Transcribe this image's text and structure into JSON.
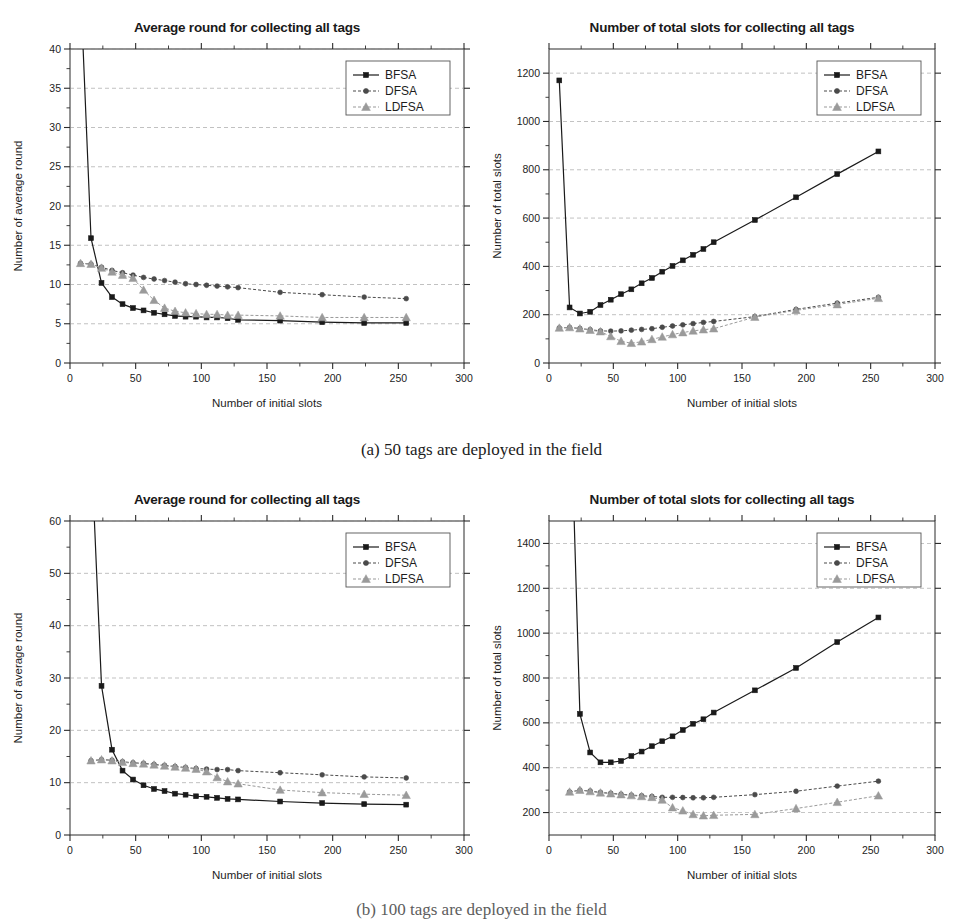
{
  "figure": {
    "caption_a": "(a) 50 tags are deployed in the field",
    "caption_b": "(b) 100 tags are deployed in the field",
    "series_names": [
      "BFSA",
      "DFSA",
      "LDFSA"
    ],
    "colors": {
      "bfsa": "#1a1a1a",
      "dfsa": "#4a4a4a",
      "ldfsa": "#9a9a9a",
      "grid": "#8a8a8a",
      "axis": "#2b2b2b"
    }
  },
  "chart_data": [
    {
      "id": "a-left",
      "type": "line",
      "title": "Average round for collecting all tags",
      "xlabel": "Number of initial slots",
      "ylabel": "Number of average round",
      "xlim": [
        0,
        300
      ],
      "ylim": [
        0,
        40
      ],
      "xticks": [
        0,
        50,
        100,
        150,
        200,
        250,
        300
      ],
      "yticks": [
        0,
        5,
        10,
        15,
        20,
        25,
        30,
        35,
        40
      ],
      "grid": true,
      "legend_position": "top-right",
      "series": [
        {
          "name": "BFSA",
          "marker": "square",
          "x": [
            8,
            16,
            24,
            32,
            40,
            48,
            56,
            64,
            72,
            80,
            88,
            96,
            104,
            112,
            120,
            128,
            160,
            192,
            224,
            256
          ],
          "y": [
            48.0,
            15.9,
            10.2,
            8.4,
            7.5,
            7.0,
            6.7,
            6.4,
            6.2,
            6.0,
            5.9,
            5.9,
            5.8,
            5.8,
            5.7,
            5.5,
            5.4,
            5.2,
            5.1,
            5.1
          ]
        },
        {
          "name": "DFSA",
          "marker": "circle",
          "x": [
            8,
            16,
            24,
            32,
            40,
            48,
            56,
            64,
            72,
            80,
            88,
            96,
            104,
            112,
            120,
            128,
            160,
            192,
            224,
            256
          ],
          "y": [
            12.7,
            12.6,
            12.2,
            11.8,
            11.5,
            11.2,
            10.9,
            10.7,
            10.5,
            10.3,
            10.1,
            10.0,
            9.9,
            9.8,
            9.7,
            9.6,
            9.0,
            8.7,
            8.4,
            8.2
          ]
        },
        {
          "name": "LDFSA",
          "marker": "triangle",
          "x": [
            8,
            16,
            24,
            32,
            40,
            48,
            56,
            64,
            72,
            80,
            88,
            96,
            104,
            112,
            120,
            128,
            160,
            192,
            224,
            256
          ],
          "y": [
            12.7,
            12.6,
            12.1,
            11.6,
            11.2,
            10.8,
            9.3,
            8.0,
            7.0,
            6.6,
            6.4,
            6.3,
            6.2,
            6.2,
            6.1,
            6.1,
            6.0,
            5.8,
            5.8,
            5.8
          ]
        }
      ]
    },
    {
      "id": "a-right",
      "type": "line",
      "title": "Number of total slots for collecting all tags",
      "xlabel": "Number of initial slots",
      "ylabel": "Number of total slots",
      "xlim": [
        0,
        300
      ],
      "ylim": [
        0,
        1300
      ],
      "xticks": [
        0,
        50,
        100,
        150,
        200,
        250,
        300
      ],
      "yticks": [
        0,
        200,
        400,
        600,
        800,
        1000,
        1200
      ],
      "grid": true,
      "legend_position": "top-right",
      "series": [
        {
          "name": "BFSA",
          "marker": "square",
          "x": [
            8,
            16,
            24,
            32,
            40,
            48,
            56,
            64,
            72,
            80,
            88,
            96,
            104,
            112,
            120,
            128,
            160,
            192,
            224,
            256
          ],
          "y": [
            1170,
            230,
            205,
            212,
            240,
            262,
            285,
            305,
            330,
            352,
            378,
            402,
            425,
            448,
            472,
            500,
            592,
            686,
            782,
            876
          ]
        },
        {
          "name": "DFSA",
          "marker": "circle",
          "x": [
            8,
            16,
            24,
            32,
            40,
            48,
            56,
            64,
            72,
            80,
            88,
            96,
            104,
            112,
            120,
            128,
            160,
            192,
            224,
            256
          ],
          "y": [
            145,
            147,
            143,
            138,
            133,
            132,
            133,
            136,
            139,
            142,
            148,
            153,
            158,
            163,
            168,
            172,
            192,
            222,
            248,
            272
          ]
        },
        {
          "name": "LDFSA",
          "marker": "triangle",
          "x": [
            8,
            16,
            24,
            32,
            40,
            48,
            56,
            64,
            72,
            80,
            88,
            96,
            104,
            112,
            120,
            128,
            160,
            192,
            224,
            256
          ],
          "y": [
            145,
            147,
            142,
            136,
            130,
            110,
            90,
            82,
            88,
            98,
            108,
            118,
            126,
            133,
            138,
            142,
            190,
            218,
            242,
            268
          ]
        }
      ]
    },
    {
      "id": "b-left",
      "type": "line",
      "title": "Average round for collecting all tags",
      "xlabel": "Number of initial slots",
      "ylabel": "Number of average round",
      "xlim": [
        0,
        300
      ],
      "ylim": [
        0,
        60
      ],
      "xticks": [
        0,
        50,
        100,
        150,
        200,
        250,
        300
      ],
      "yticks": [
        0,
        10,
        20,
        30,
        40,
        50,
        60
      ],
      "grid": true,
      "legend_position": "top-right",
      "series": [
        {
          "name": "BFSA",
          "marker": "square",
          "x": [
            16,
            24,
            32,
            40,
            48,
            56,
            64,
            72,
            80,
            88,
            96,
            104,
            112,
            120,
            128,
            160,
            192,
            224,
            256
          ],
          "y": [
            75.0,
            28.5,
            16.3,
            12.3,
            10.6,
            9.5,
            8.8,
            8.4,
            7.9,
            7.7,
            7.4,
            7.3,
            7.1,
            6.9,
            6.8,
            6.4,
            6.1,
            5.9,
            5.8
          ]
        },
        {
          "name": "DFSA",
          "marker": "circle",
          "x": [
            16,
            24,
            32,
            40,
            48,
            56,
            64,
            72,
            80,
            88,
            96,
            104,
            112,
            120,
            128,
            160,
            192,
            224,
            256
          ],
          "y": [
            14.2,
            14.4,
            14.3,
            14.0,
            13.8,
            13.7,
            13.5,
            13.3,
            13.1,
            12.9,
            12.7,
            12.6,
            12.5,
            12.5,
            12.3,
            11.9,
            11.5,
            11.1,
            10.9
          ]
        },
        {
          "name": "LDFSA",
          "marker": "triangle",
          "x": [
            16,
            24,
            32,
            40,
            48,
            56,
            64,
            72,
            80,
            88,
            96,
            104,
            112,
            120,
            128,
            160,
            192,
            224,
            256
          ],
          "y": [
            14.2,
            14.4,
            14.2,
            13.9,
            13.7,
            13.6,
            13.4,
            13.2,
            13.0,
            12.8,
            12.6,
            12.1,
            11.0,
            10.2,
            9.8,
            8.6,
            8.1,
            7.8,
            7.6
          ]
        }
      ]
    },
    {
      "id": "b-right",
      "type": "line",
      "title": "Number of total slots for collecting all tags",
      "xlabel": "Number of initial slots",
      "ylabel": "Number of total slots",
      "xlim": [
        0,
        300
      ],
      "ylim": [
        100,
        1500
      ],
      "xticks": [
        0,
        50,
        100,
        150,
        200,
        250,
        300
      ],
      "yticks": [
        200,
        400,
        600,
        800,
        1000,
        1200,
        1400
      ],
      "grid": true,
      "legend_position": "top-right",
      "series": [
        {
          "name": "BFSA",
          "marker": "square",
          "x": [
            16,
            24,
            32,
            40,
            48,
            56,
            64,
            72,
            80,
            88,
            96,
            104,
            112,
            120,
            128,
            160,
            192,
            224,
            256
          ],
          "y": [
            2200,
            640,
            468,
            424,
            424,
            430,
            452,
            472,
            496,
            518,
            540,
            568,
            596,
            616,
            646,
            745,
            845,
            960,
            1070
          ]
        },
        {
          "name": "DFSA",
          "marker": "circle",
          "x": [
            16,
            24,
            32,
            40,
            48,
            56,
            64,
            72,
            80,
            88,
            96,
            104,
            112,
            120,
            128,
            160,
            192,
            224,
            256
          ],
          "y": [
            292,
            300,
            296,
            290,
            286,
            282,
            278,
            275,
            272,
            268,
            268,
            267,
            266,
            266,
            268,
            280,
            295,
            318,
            340
          ]
        },
        {
          "name": "LDFSA",
          "marker": "triangle",
          "x": [
            16,
            24,
            32,
            40,
            48,
            56,
            64,
            72,
            80,
            88,
            96,
            104,
            112,
            120,
            128,
            160,
            192,
            224,
            256
          ],
          "y": [
            292,
            300,
            294,
            288,
            284,
            280,
            276,
            272,
            268,
            256,
            222,
            208,
            192,
            186,
            188,
            192,
            218,
            246,
            275
          ]
        }
      ]
    }
  ]
}
